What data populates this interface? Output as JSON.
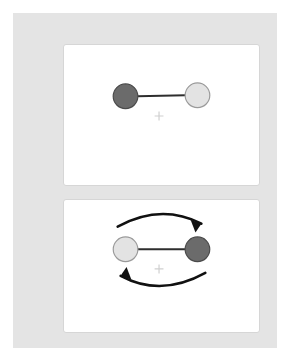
{
  "figure": {
    "background_color": "#ffffff",
    "canvas_color": "#e4e4e4",
    "panel_color": "#ffffff",
    "panel_border_color": "#d6d6d6"
  },
  "colors": {
    "dark_ball_fill": "#6b6b6b",
    "dark_ball_stroke": "#4a4a4a",
    "light_ball_fill": "#e3e3e3",
    "light_ball_stroke": "#9a9a9a",
    "rod_color": "#2e2e2e",
    "arrow_color": "#111111",
    "fixation_color": "#cfcfcf"
  },
  "panels": [
    {
      "name": "initial-configuration-panel",
      "position": "top",
      "balls": [
        {
          "name": "dark-ball",
          "shade": "dark",
          "side": "left",
          "cx": 62,
          "cy": 52,
          "r": 12.5
        },
        {
          "name": "light-ball",
          "shade": "light",
          "side": "right",
          "cx": 135,
          "cy": 51,
          "r": 12.5
        }
      ],
      "rod": {
        "name": "connecting-rod",
        "x1": 74,
        "y1": 52,
        "x2": 123,
        "y2": 51
      },
      "fixation": {
        "name": "fixation-cross",
        "symbol": "+",
        "cx": 96,
        "cy": 72,
        "size": 9
      },
      "arrows": []
    },
    {
      "name": "rotated-configuration-panel",
      "position": "bottom",
      "balls": [
        {
          "name": "light-ball",
          "shade": "light",
          "side": "left",
          "cx": 62,
          "cy": 50,
          "r": 12.5
        },
        {
          "name": "dark-ball",
          "shade": "dark",
          "side": "right",
          "cx": 135,
          "cy": 50,
          "r": 12.5
        }
      ],
      "rod": {
        "name": "connecting-rod",
        "x1": 74,
        "y1": 50,
        "x2": 123,
        "y2": 50
      },
      "fixation": {
        "name": "fixation-cross",
        "symbol": "+",
        "cx": 96,
        "cy": 70,
        "size": 9
      },
      "arrows": [
        {
          "name": "rotation-arrow-top",
          "direction": "clockwise-left-to-right",
          "path": "M 54 27 Q 98 3 139 24",
          "head_points": "139,24 128,20 133,33",
          "head_rotation": 0
        },
        {
          "name": "rotation-arrow-bottom",
          "direction": "clockwise-right-to-left",
          "path": "M 143 74 Q 98 99 57 77",
          "head_points": "57,77 68,81 63,68",
          "head_rotation": 0
        }
      ]
    }
  ]
}
